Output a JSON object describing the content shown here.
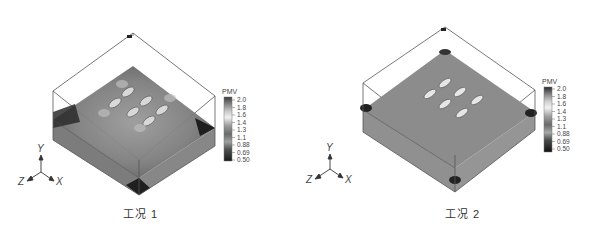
{
  "figure": {
    "panels": [
      {
        "caption": "工况 1",
        "colorbar": {
          "title": "PMV",
          "ticks": [
            "2.0",
            "1.8",
            "1.6",
            "1.4",
            "1.3",
            "1.1",
            "0.88",
            "0.69",
            "0.50"
          ]
        },
        "axes": {
          "y": "Y",
          "z": "Z",
          "x": "X"
        }
      },
      {
        "caption": "工况 2",
        "colorbar": {
          "title": "PMV",
          "ticks": [
            "2.0",
            "1.8",
            "1.6",
            "1.4",
            "1.3",
            "1.1",
            "0.88",
            "0.69",
            "0.50"
          ]
        },
        "axes": {
          "y": "Y",
          "z": "Z",
          "x": "X"
        }
      }
    ]
  }
}
